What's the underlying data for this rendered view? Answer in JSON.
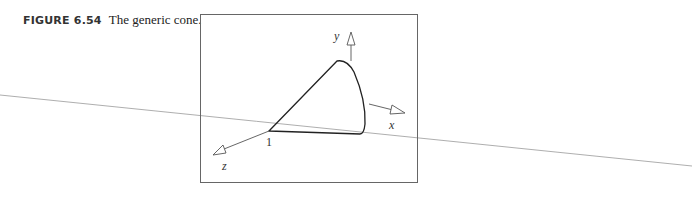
{
  "caption": {
    "figure_number": "FIGURE 6.54",
    "text": "The generic cone."
  },
  "figure": {
    "axis_labels": {
      "x": "x",
      "y": "y",
      "z": "z"
    },
    "apex_label": "1"
  }
}
